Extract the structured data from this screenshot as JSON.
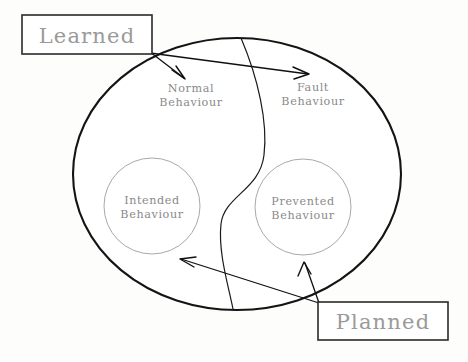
{
  "diagram": {
    "background_color": "#fdfdfc",
    "outer_shape": {
      "name": "system-behaviour-ellipse",
      "stroke_color": "#141414",
      "cx": 237,
      "cy": 174,
      "rx": 164,
      "ry": 136
    },
    "divider": {
      "name": "s-curve-divider",
      "stroke_color": "#1a1a1a",
      "description": "S-shaped curve splitting the ellipse into a left (Normal/Intended) half and a right (Fault/Prevented) half"
    },
    "callout_boxes": [
      {
        "id": "learned",
        "label": "Learned",
        "x": 22,
        "y": 15,
        "width": 130,
        "height": 39,
        "text_color": "#9a9a9a",
        "border_color": "#2a2a2a"
      },
      {
        "id": "planned",
        "label": "Planned",
        "x": 318,
        "y": 302,
        "width": 130,
        "height": 38,
        "text_color": "#9a9a9a",
        "border_color": "#2a2a2a"
      }
    ],
    "region_labels": [
      {
        "id": "normal-behaviour",
        "line1": "Normal",
        "line2": "Behaviour",
        "x": 191,
        "y": 91,
        "text_color": "#8a8a8a"
      },
      {
        "id": "fault-behaviour",
        "line1": "Fault",
        "line2": "Behaviour",
        "x": 313,
        "y": 90,
        "text_color": "#8a8a8a"
      }
    ],
    "inner_circles": [
      {
        "id": "intended-behaviour",
        "line1": "Intended",
        "line2": "Behaviour",
        "cx": 152,
        "cy": 206,
        "r": 48,
        "stroke_color": "#a9a9a9",
        "text_color": "#8a8a8a"
      },
      {
        "id": "prevented-behaviour",
        "line1": "Prevented",
        "line2": "Behaviour",
        "cx": 303,
        "cy": 207,
        "r": 48,
        "stroke_color": "#a9a9a9",
        "text_color": "#8a8a8a"
      }
    ],
    "connectors": [
      {
        "id": "learned-to-normal",
        "from": "learned",
        "to": "normal-behaviour",
        "stroke_color": "#101010"
      },
      {
        "id": "learned-to-fault",
        "from": "learned",
        "to": "fault-behaviour",
        "stroke_color": "#101010"
      },
      {
        "id": "planned-to-intended",
        "from": "planned",
        "to": "intended-behaviour",
        "stroke_color": "#101010"
      },
      {
        "id": "planned-to-prevented",
        "from": "planned",
        "to": "prevented-behaviour",
        "stroke_color": "#101010"
      }
    ]
  }
}
